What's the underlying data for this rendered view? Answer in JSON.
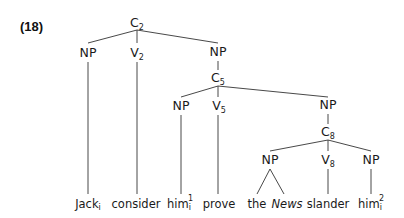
{
  "example_number": "(18)",
  "tree": {
    "nodes": {
      "c2": {
        "label": "C",
        "sub": "2"
      },
      "np1": {
        "label": "NP",
        "sub": ""
      },
      "v2": {
        "label": "V",
        "sub": "2"
      },
      "np2": {
        "label": "NP",
        "sub": ""
      },
      "c5": {
        "label": "C",
        "sub": "5"
      },
      "np3": {
        "label": "NP",
        "sub": ""
      },
      "v5": {
        "label": "V",
        "sub": "5"
      },
      "np4": {
        "label": "NP",
        "sub": ""
      },
      "c8": {
        "label": "C",
        "sub": "8"
      },
      "np5": {
        "label": "NP",
        "sub": ""
      },
      "v8": {
        "label": "V",
        "sub": "8"
      },
      "np6": {
        "label": "NP",
        "sub": ""
      }
    },
    "leaves": [
      {
        "text": "Jack",
        "sub": "i",
        "sup": ""
      },
      {
        "text": "consider",
        "sub": "",
        "sup": ""
      },
      {
        "text": "him",
        "sub": "i",
        "sup": "1"
      },
      {
        "text": "prove",
        "sub": "",
        "sup": ""
      },
      {
        "text": "the",
        "sub": "",
        "sup": ""
      },
      {
        "text": "News",
        "sub": "",
        "sup": "",
        "italic": true
      },
      {
        "text": "slander",
        "sub": "",
        "sup": ""
      },
      {
        "text": "him",
        "sub": "i",
        "sup": "2"
      }
    ]
  }
}
